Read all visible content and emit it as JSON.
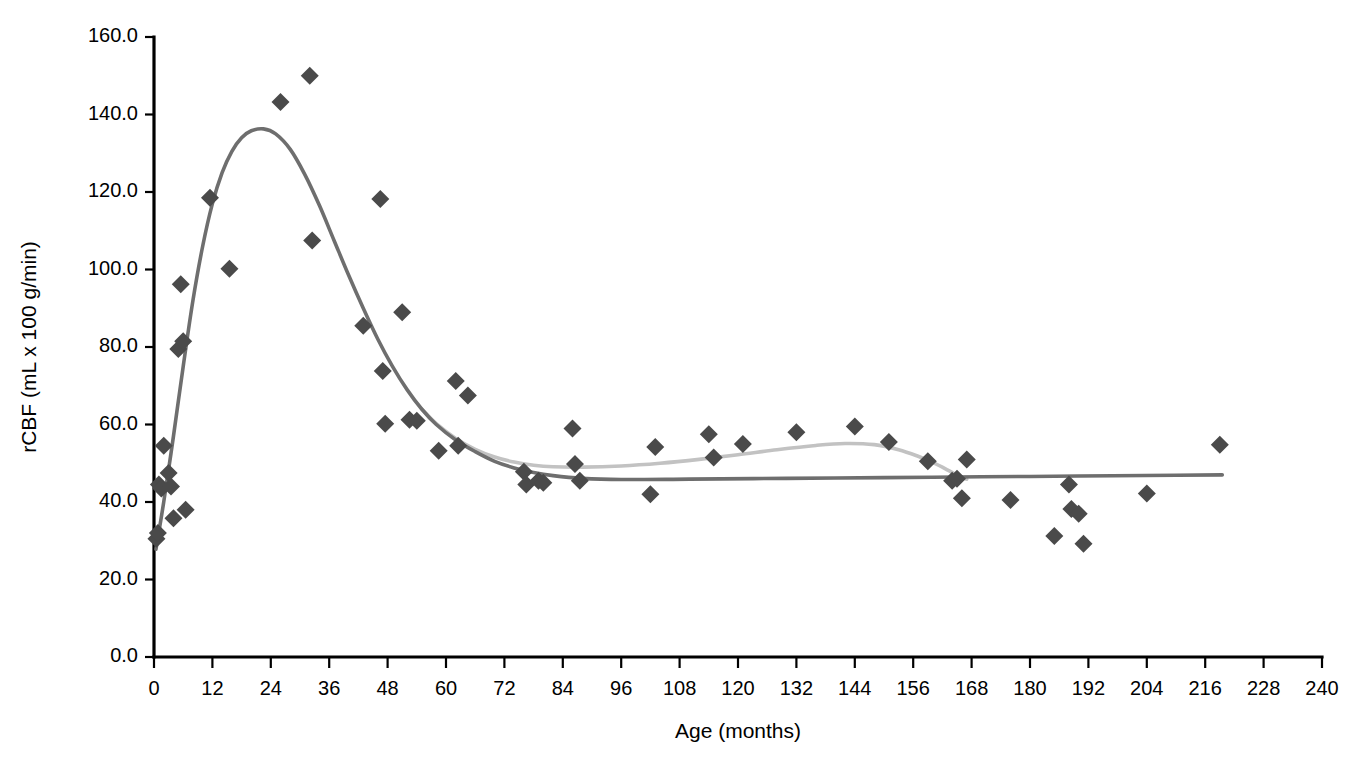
{
  "chart_data": {
    "type": "scatter",
    "title": "",
    "xlabel": "Age (months)",
    "ylabel": "rCBF (mL x 100 g/min)",
    "xlim": [
      0,
      240
    ],
    "ylim": [
      0,
      160
    ],
    "xticks": [
      0,
      12,
      24,
      36,
      48,
      60,
      72,
      84,
      96,
      108,
      120,
      132,
      144,
      156,
      168,
      180,
      192,
      204,
      216,
      228,
      240
    ],
    "xtick_labels": [
      "0",
      "12",
      "24",
      "36",
      "48",
      "60",
      "72",
      "84",
      "96",
      "108",
      "120",
      "132",
      "144",
      "156",
      "168",
      "180",
      "192",
      "204",
      "216",
      "228",
      "240"
    ],
    "yticks": [
      0,
      20,
      40,
      60,
      80,
      100,
      120,
      140,
      160
    ],
    "ytick_labels": [
      "0.0",
      "20.0",
      "40.0",
      "60.0",
      "80.0",
      "100.0",
      "120.0",
      "140.0",
      "160.0"
    ],
    "grid": false,
    "legend": "none",
    "marker_shape": "diamond",
    "marker_color": "#4a4a4a",
    "marker_size": 15,
    "points": [
      {
        "x": 0.5,
        "y": 30.5
      },
      {
        "x": 0.8,
        "y": 32.0
      },
      {
        "x": 1.0,
        "y": 44.5
      },
      {
        "x": 1.5,
        "y": 43.5
      },
      {
        "x": 2.0,
        "y": 54.5
      },
      {
        "x": 3.0,
        "y": 47.5
      },
      {
        "x": 3.5,
        "y": 44.0
      },
      {
        "x": 4.0,
        "y": 35.8
      },
      {
        "x": 5.0,
        "y": 79.5
      },
      {
        "x": 5.5,
        "y": 96.2
      },
      {
        "x": 6.0,
        "y": 81.5
      },
      {
        "x": 6.5,
        "y": 38.0
      },
      {
        "x": 11.5,
        "y": 118.5
      },
      {
        "x": 15.5,
        "y": 100.2
      },
      {
        "x": 26.0,
        "y": 143.2
      },
      {
        "x": 32.0,
        "y": 150.0
      },
      {
        "x": 32.5,
        "y": 107.5
      },
      {
        "x": 43.0,
        "y": 85.5
      },
      {
        "x": 46.5,
        "y": 118.2
      },
      {
        "x": 47.0,
        "y": 73.8
      },
      {
        "x": 47.5,
        "y": 60.2
      },
      {
        "x": 51.0,
        "y": 89.0
      },
      {
        "x": 52.5,
        "y": 61.2
      },
      {
        "x": 54.0,
        "y": 61.0
      },
      {
        "x": 58.5,
        "y": 53.2
      },
      {
        "x": 62.0,
        "y": 71.2
      },
      {
        "x": 62.5,
        "y": 54.5
      },
      {
        "x": 64.5,
        "y": 67.5
      },
      {
        "x": 76.0,
        "y": 47.8
      },
      {
        "x": 76.5,
        "y": 44.5
      },
      {
        "x": 79.0,
        "y": 45.5
      },
      {
        "x": 80.0,
        "y": 45.0
      },
      {
        "x": 86.0,
        "y": 59.0
      },
      {
        "x": 86.5,
        "y": 49.8
      },
      {
        "x": 87.5,
        "y": 45.5
      },
      {
        "x": 102.0,
        "y": 42.0
      },
      {
        "x": 103.0,
        "y": 54.2
      },
      {
        "x": 114.0,
        "y": 57.5
      },
      {
        "x": 115.0,
        "y": 51.5
      },
      {
        "x": 121.0,
        "y": 55.0
      },
      {
        "x": 132.0,
        "y": 58.0
      },
      {
        "x": 144.0,
        "y": 59.5
      },
      {
        "x": 151.0,
        "y": 55.5
      },
      {
        "x": 159.0,
        "y": 50.5
      },
      {
        "x": 164.0,
        "y": 45.5
      },
      {
        "x": 165.0,
        "y": 46.0
      },
      {
        "x": 166.0,
        "y": 41.0
      },
      {
        "x": 167.0,
        "y": 51.0
      },
      {
        "x": 176.0,
        "y": 40.5
      },
      {
        "x": 185.0,
        "y": 31.2
      },
      {
        "x": 188.0,
        "y": 44.5
      },
      {
        "x": 188.5,
        "y": 38.2
      },
      {
        "x": 190.0,
        "y": 37.0
      },
      {
        "x": 191.0,
        "y": 29.2
      },
      {
        "x": 204.0,
        "y": 42.2
      },
      {
        "x": 219.0,
        "y": 54.8
      }
    ],
    "curves": [
      {
        "name": "primary-fit",
        "color": "#6e6e6e",
        "points": [
          {
            "x": 0.4,
            "y": 27.8
          },
          {
            "x": 2.0,
            "y": 40.0
          },
          {
            "x": 4.0,
            "y": 57.0
          },
          {
            "x": 6.0,
            "y": 75.0
          },
          {
            "x": 8.0,
            "y": 92.0
          },
          {
            "x": 10.0,
            "y": 106.0
          },
          {
            "x": 12.0,
            "y": 117.0
          },
          {
            "x": 14.0,
            "y": 125.0
          },
          {
            "x": 16.0,
            "y": 130.5
          },
          {
            "x": 18.0,
            "y": 134.0
          },
          {
            "x": 20.0,
            "y": 135.8
          },
          {
            "x": 22.5,
            "y": 136.3
          },
          {
            "x": 25.0,
            "y": 135.0
          },
          {
            "x": 28.0,
            "y": 131.0
          },
          {
            "x": 31.0,
            "y": 124.5
          },
          {
            "x": 34.0,
            "y": 116.5
          },
          {
            "x": 37.0,
            "y": 107.5
          },
          {
            "x": 40.0,
            "y": 98.5
          },
          {
            "x": 43.0,
            "y": 90.0
          },
          {
            "x": 46.0,
            "y": 82.0
          },
          {
            "x": 49.0,
            "y": 75.0
          },
          {
            "x": 52.0,
            "y": 69.0
          },
          {
            "x": 55.0,
            "y": 64.0
          },
          {
            "x": 58.0,
            "y": 60.0
          },
          {
            "x": 62.0,
            "y": 56.0
          },
          {
            "x": 66.0,
            "y": 53.0
          },
          {
            "x": 70.0,
            "y": 50.5
          },
          {
            "x": 74.0,
            "y": 48.8
          },
          {
            "x": 78.0,
            "y": 47.6
          },
          {
            "x": 82.0,
            "y": 46.8
          },
          {
            "x": 88.0,
            "y": 46.1
          },
          {
            "x": 96.0,
            "y": 45.8
          },
          {
            "x": 110.0,
            "y": 45.9
          },
          {
            "x": 130.0,
            "y": 46.1
          },
          {
            "x": 150.0,
            "y": 46.3
          },
          {
            "x": 170.0,
            "y": 46.5
          },
          {
            "x": 190.0,
            "y": 46.7
          },
          {
            "x": 210.0,
            "y": 46.9
          },
          {
            "x": 219.5,
            "y": 47.0
          }
        ]
      },
      {
        "name": "secondary-fit",
        "color": "#c2c2c2",
        "points": [
          {
            "x": 55.0,
            "y": 64.0
          },
          {
            "x": 58.0,
            "y": 60.2
          },
          {
            "x": 62.0,
            "y": 56.4
          },
          {
            "x": 66.0,
            "y": 53.6
          },
          {
            "x": 70.0,
            "y": 51.6
          },
          {
            "x": 74.0,
            "y": 50.3
          },
          {
            "x": 78.0,
            "y": 49.5
          },
          {
            "x": 82.0,
            "y": 49.1
          },
          {
            "x": 88.0,
            "y": 49.0
          },
          {
            "x": 96.0,
            "y": 49.3
          },
          {
            "x": 104.0,
            "y": 50.0
          },
          {
            "x": 112.0,
            "y": 51.0
          },
          {
            "x": 120.0,
            "y": 52.2
          },
          {
            "x": 128.0,
            "y": 53.5
          },
          {
            "x": 136.0,
            "y": 54.6
          },
          {
            "x": 142.0,
            "y": 55.1
          },
          {
            "x": 148.0,
            "y": 54.8
          },
          {
            "x": 153.0,
            "y": 53.5
          },
          {
            "x": 157.0,
            "y": 51.8
          },
          {
            "x": 160.0,
            "y": 50.2
          },
          {
            "x": 163.0,
            "y": 48.3
          },
          {
            "x": 165.5,
            "y": 46.6
          },
          {
            "x": 167.0,
            "y": 45.9
          }
        ]
      }
    ]
  }
}
